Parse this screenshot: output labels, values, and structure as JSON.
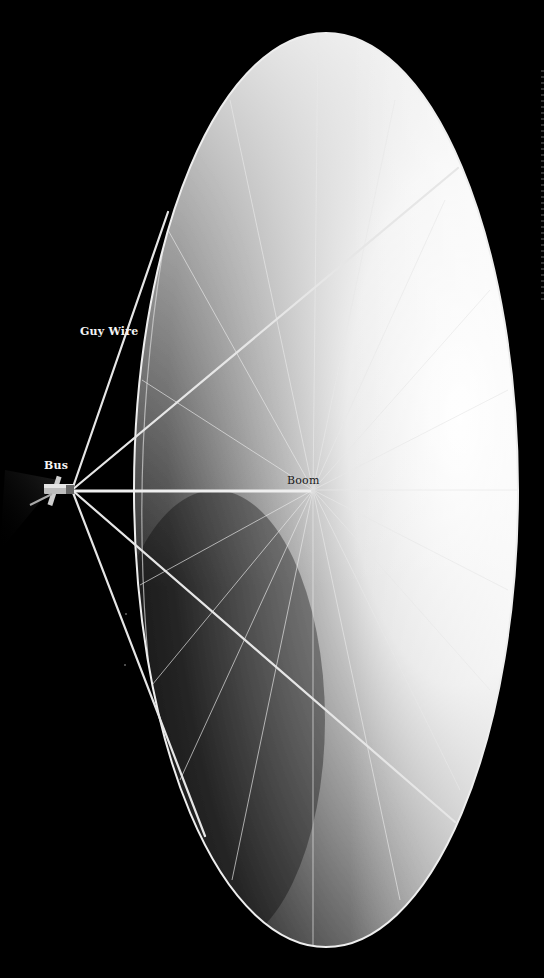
{
  "diagram": {
    "title": "",
    "background_color": "#000000",
    "labels": {
      "bus": "Bus",
      "guy_wire": "Guy Wire",
      "boom": "Boom"
    },
    "geometry": {
      "reflector_center": [
        326,
        490
      ],
      "reflector_rx": 192,
      "reflector_ry": 457,
      "bus_position": [
        62,
        490
      ],
      "boom_hub": [
        313,
        490
      ],
      "rib_count": 24
    },
    "colors": {
      "reflector_light": "#f2f2f2",
      "reflector_mid": "#9a9a9a",
      "reflector_dark": "#2a2a2a",
      "wire": "#e6e6e6",
      "label_on_black": "#f4f4f4",
      "label_on_reflector": "#1a1a1a"
    }
  }
}
